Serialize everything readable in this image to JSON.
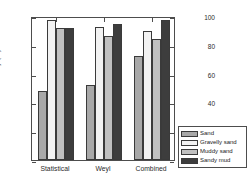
{
  "chart_data": {
    "type": "bar",
    "title": "",
    "xlabel": "",
    "ylabel": "Classification accuracy (%)",
    "categories": [
      "Statistical",
      "Weyl",
      "Combined"
    ],
    "series": [
      {
        "name": "Sand",
        "color": "#a8a8a8",
        "values": [
          48,
          52,
          72
        ]
      },
      {
        "name": "Gravelly sand",
        "color": "#f2f2f2",
        "values": [
          97.5,
          92.5,
          89.5
        ]
      },
      {
        "name": "Muddy sand",
        "color": "#c0c0c0",
        "values": [
          91.5,
          86,
          84
        ]
      },
      {
        "name": "Sandy mud",
        "color": "#3d3d3d",
        "values": [
          91.5,
          94.5,
          97.5
        ]
      }
    ],
    "ylim": [
      0,
      100
    ],
    "yticks": [
      0,
      20,
      40,
      60,
      80,
      100
    ],
    "ytick_labels": [
      "0",
      "20",
      "40",
      "60",
      "80",
      "100"
    ],
    "grid": false,
    "legend_position": "outside-bottom-right",
    "axis_color": "#4d4d4d"
  }
}
